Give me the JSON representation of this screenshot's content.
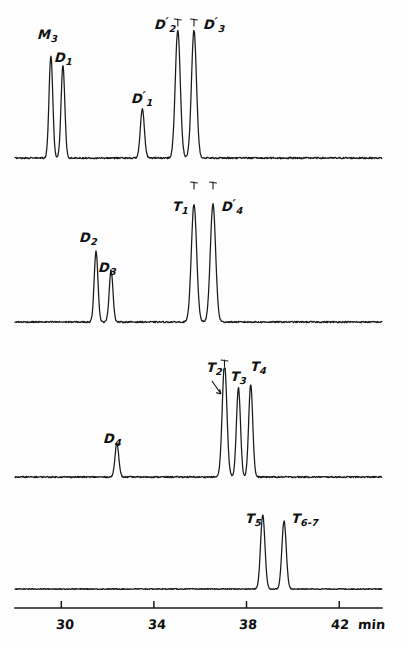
{
  "chart_data": {
    "type": "line",
    "title": "",
    "subtitle": "",
    "xlabel": "min",
    "ylabel": "",
    "xlim": [
      28.0,
      43.85
    ],
    "grid": false,
    "legend": "none",
    "x_ticks": [
      30,
      34,
      38,
      42
    ],
    "x_tick_labels": [
      "30",
      "34",
      "38",
      "42"
    ],
    "axis_unit_label": "min",
    "panel_count": 4,
    "series": [
      {
        "name": "trace-1",
        "baseline_noise": 0.012,
        "peaks": [
          {
            "label": "M",
            "sub": "3",
            "prime": false,
            "x": 29.55,
            "height": 0.8,
            "width": 0.12,
            "clipped": false
          },
          {
            "label": "D",
            "sub": "1",
            "prime": false,
            "x": 30.07,
            "height": 0.72,
            "width": 0.12,
            "clipped": false
          },
          {
            "label": "D",
            "sub": "1",
            "prime": true,
            "x": 33.5,
            "height": 0.38,
            "width": 0.13,
            "clipped": false
          },
          {
            "label": "D",
            "sub": "2",
            "prime": true,
            "x": 35.03,
            "height": 1.0,
            "width": 0.16,
            "clipped": true
          },
          {
            "label": "D",
            "sub": "3",
            "prime": true,
            "x": 35.73,
            "height": 1.0,
            "width": 0.16,
            "clipped": true
          }
        ]
      },
      {
        "name": "trace-2",
        "baseline_noise": 0.012,
        "peaks": [
          {
            "label": "D",
            "sub": "2",
            "prime": false,
            "x": 31.5,
            "height": 0.6,
            "width": 0.12,
            "clipped": false
          },
          {
            "label": "D",
            "sub": "3",
            "prime": false,
            "x": 32.15,
            "height": 0.44,
            "width": 0.12,
            "clipped": false
          },
          {
            "label": "T",
            "sub": "1",
            "prime": false,
            "x": 35.73,
            "height": 1.0,
            "width": 0.17,
            "clipped": true
          },
          {
            "label": "D",
            "sub": "4",
            "prime": true,
            "x": 36.55,
            "height": 1.0,
            "width": 0.17,
            "clipped": true
          }
        ]
      },
      {
        "name": "trace-3",
        "baseline_noise": 0.012,
        "peaks": [
          {
            "label": "D",
            "sub": "4",
            "prime": false,
            "x": 32.4,
            "height": 0.3,
            "width": 0.12,
            "clipped": false
          },
          {
            "label": "T",
            "sub": "2",
            "prime": false,
            "x": 37.05,
            "height": 1.0,
            "width": 0.15,
            "clipped": true
          },
          {
            "label": "T",
            "sub": "3",
            "prime": false,
            "x": 37.65,
            "height": 0.79,
            "width": 0.13,
            "clipped": false
          },
          {
            "label": "T",
            "sub": "4",
            "prime": false,
            "x": 38.18,
            "height": 0.82,
            "width": 0.13,
            "clipped": false
          }
        ]
      },
      {
        "name": "trace-4",
        "baseline_noise": 0.012,
        "peaks": [
          {
            "label": "T",
            "sub": "5",
            "prime": false,
            "x": 38.7,
            "height": 0.95,
            "width": 0.14,
            "clipped": false
          },
          {
            "label": "T",
            "sub": "6-7",
            "prime": false,
            "x": 39.62,
            "height": 0.87,
            "width": 0.14,
            "clipped": false
          }
        ]
      }
    ],
    "annotations": [
      {
        "name": "t2-pointer-arrow",
        "from_label": "T2",
        "to_peak": "T2",
        "style": "short diagonal arrow pointing down-right"
      }
    ]
  },
  "labels": {
    "m3": "M",
    "m3_sub": "3",
    "d1": "D",
    "d1_sub": "1",
    "d1p": "D",
    "d1p_sub": "1",
    "d2p": "D",
    "d2p_sub": "2",
    "d3p": "D",
    "d3p_sub": "3",
    "d2": "D",
    "d2_sub": "2",
    "d3": "D",
    "d3_sub": "3",
    "t1": "T",
    "t1_sub": "1",
    "d4p": "D",
    "d4p_sub": "4",
    "d4": "D",
    "d4_sub": "4",
    "t2": "T",
    "t2_sub": "2",
    "t3": "T",
    "t3_sub": "3",
    "t4": "T",
    "t4_sub": "4",
    "t5": "T",
    "t5_sub": "5",
    "t67": "T",
    "t67_sub": "6-7",
    "prime_mark": "′"
  },
  "axis": {
    "tick_30": "30",
    "tick_34": "34",
    "tick_38": "38",
    "tick_42": "42",
    "unit": "min"
  },
  "colors": {
    "ink": "#1a1a1a",
    "paper": "#fefefe"
  }
}
